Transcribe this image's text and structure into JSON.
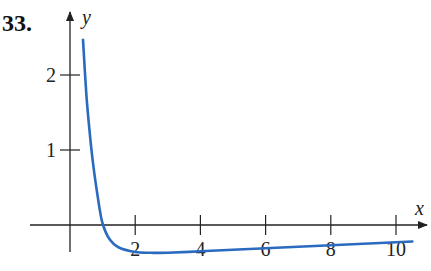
{
  "problem_number": "33.",
  "chart_data": {
    "type": "line",
    "title": "",
    "xlabel": "x",
    "ylabel": "y",
    "x_ticks": [
      2,
      4,
      6,
      8,
      10
    ],
    "y_ticks": [
      1,
      2
    ],
    "xlim": [
      0,
      11
    ],
    "ylim": [
      -0.5,
      2.6
    ],
    "grid": false,
    "legend": null,
    "curve_color": "#2a6bbf",
    "series": [
      {
        "name": "curve",
        "x": [
          0.4,
          0.5,
          0.6,
          0.7,
          0.8,
          0.9,
          1.0,
          1.2,
          1.5,
          2.0,
          2.5,
          3.0,
          4.0,
          5.0,
          6.0,
          7.0,
          8.0,
          9.0,
          10.0,
          10.5
        ],
        "y": [
          2.47,
          1.75,
          1.25,
          0.85,
          0.52,
          0.24,
          0.02,
          -0.18,
          -0.3,
          -0.36,
          -0.37,
          -0.37,
          -0.35,
          -0.33,
          -0.31,
          -0.29,
          -0.27,
          -0.25,
          -0.23,
          -0.22
        ]
      }
    ]
  }
}
